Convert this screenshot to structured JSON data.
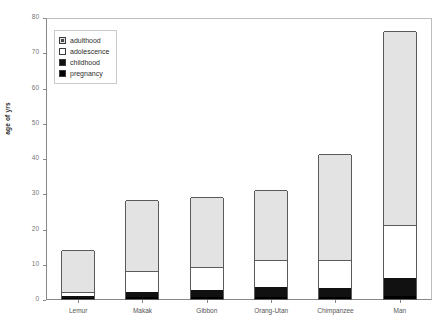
{
  "chart_data": {
    "type": "bar",
    "subtype": "stacked-bar",
    "title": "",
    "xlabel": "",
    "ylabel": "age of yrs",
    "ylim": [
      0,
      80
    ],
    "yticks": [
      0,
      10,
      20,
      30,
      40,
      50,
      60,
      70,
      80
    ],
    "grid": false,
    "legend_position": "top-left",
    "categories": [
      "Lemur",
      "Makak",
      "Gibbon",
      "Orang-Utan",
      "Chimpanzee",
      "Man"
    ],
    "series": [
      {
        "name": "pregnancy",
        "color": "#000000",
        "values": [
          0.3,
          0.5,
          0.6,
          0.7,
          0.6,
          0.75
        ]
      },
      {
        "name": "childhood",
        "color": "#111111",
        "values": [
          0.7,
          1.5,
          1.9,
          2.8,
          2.4,
          5.25
        ]
      },
      {
        "name": "adolescence",
        "color": "#ffffff",
        "values": [
          1.0,
          6.0,
          6.5,
          7.5,
          8.0,
          15.0
        ]
      },
      {
        "name": "adulthood",
        "color": "#e3e3e3",
        "values": [
          12.0,
          20.0,
          20.0,
          20.0,
          30.0,
          55.0
        ]
      }
    ],
    "totals": [
      14,
      28,
      29,
      31,
      41,
      76
    ]
  },
  "legend": {
    "items": [
      {
        "label": "adulthood",
        "key": "adulthood"
      },
      {
        "label": "adolescence",
        "key": "adolescence"
      },
      {
        "label": "childhood",
        "key": "childhood"
      },
      {
        "label": "pregnancy",
        "key": "pregnancy"
      }
    ]
  },
  "axis": {
    "y_label": "age of yrs",
    "y_ticks": [
      "0",
      "10",
      "20",
      "30",
      "40",
      "50",
      "60",
      "70",
      "80"
    ],
    "x_labels": [
      "Lemur",
      "Makak",
      "Gibbon",
      "Orang-Utan",
      "Chimpanzee",
      "Man"
    ]
  }
}
